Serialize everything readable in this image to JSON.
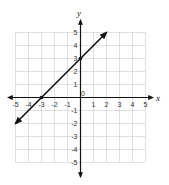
{
  "chart_data": {
    "type": "line",
    "title": "",
    "xlabel": "x",
    "ylabel": "y",
    "xlim": [
      -5,
      5
    ],
    "ylim": [
      -5,
      5
    ],
    "grid": true,
    "x_ticks": [
      "-5",
      "-4",
      "-3",
      "-2",
      "-1",
      "0",
      "1",
      "2",
      "3",
      "4",
      "5"
    ],
    "y_ticks": [
      "5",
      "4",
      "3",
      "2",
      "1",
      "-1",
      "-2",
      "-3",
      "-4",
      "-5"
    ],
    "series": [
      {
        "name": "y = x + 3",
        "x": [
          -5,
          2
        ],
        "y": [
          -2,
          5
        ],
        "points_marked": [
          [
            -3,
            0
          ],
          [
            0,
            3
          ]
        ],
        "arrows": "both",
        "color": "#111111"
      }
    ]
  },
  "labels": {
    "x_axis": "x",
    "y_axis": "y"
  }
}
